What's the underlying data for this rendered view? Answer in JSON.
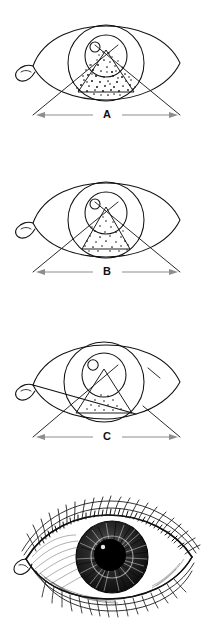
{
  "figure": {
    "title_faint": "",
    "background_color": "#ffffff",
    "ink_color": "#111111",
    "dimension_color": "#8d8d8d",
    "panels": [
      {
        "id": "panel-a",
        "label": "A",
        "description": "Schematic eye with converging light rays forming a wide illuminated cone; dense stippling of the anterior chamber",
        "stipple_density": "dense",
        "stipple_count": 62,
        "pupil_state": "constricted",
        "dimension_label": "A"
      },
      {
        "id": "panel-b",
        "label": "B",
        "description": "Schematic eye with converging light rays forming a narrower illuminated cone; moderate stippling",
        "stipple_density": "moderate",
        "stipple_count": 30,
        "pupil_state": "mid-dilated",
        "dimension_label": "B"
      },
      {
        "id": "panel-c",
        "label": "C",
        "description": "Schematic eye with converging light rays and a broken lateral ray; sparse stippling",
        "stipple_density": "sparse",
        "stipple_count": 14,
        "pupil_state": "dilated",
        "dimension_label": "C"
      }
    ],
    "photo_panel": {
      "id": "panel-photo",
      "caption": "",
      "description": "Detailed pen-and-ink rendering of a human eye with eyelashes, iris striations and dark pupil"
    }
  }
}
